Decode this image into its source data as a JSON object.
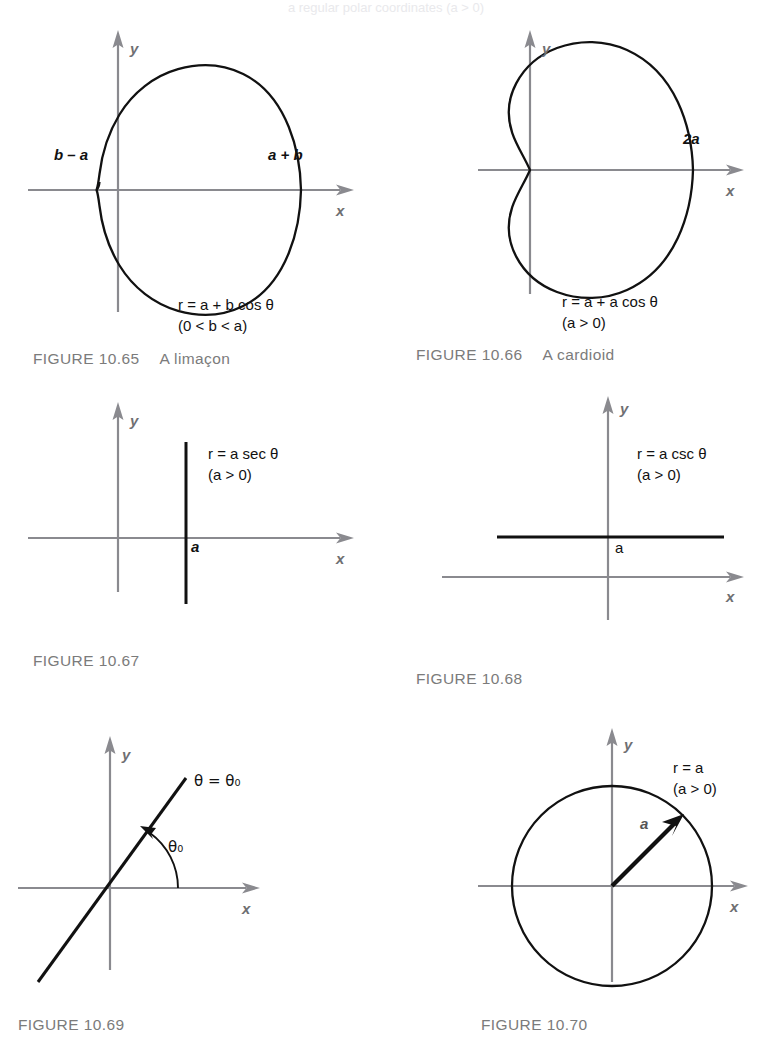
{
  "page": {
    "width": 772,
    "height": 1051,
    "background": "#ffffff",
    "top_bleed_text": "a  regular polar coordinates  (a > 0)"
  },
  "colors": {
    "curve": "#111111",
    "axis": "#8a8a8f",
    "axis_label": "#6f6f72",
    "caption": "#7b7b7b",
    "equation": "#111111"
  },
  "figures": [
    {
      "id": "fig-10-65",
      "caption_number": "FIGURE 10.65",
      "caption_description": "A limaçon",
      "equation_lines": [
        "r = a + b cos θ",
        "(0 < b < a)"
      ],
      "curve_type": "limacon",
      "axis_labels": {
        "x": "x",
        "y": "y"
      },
      "point_labels": [
        {
          "name": "left-intercept-label",
          "text": "b – a"
        },
        {
          "name": "right-intercept-label",
          "text": "a + b"
        }
      ]
    },
    {
      "id": "fig-10-66",
      "caption_number": "FIGURE 10.66",
      "caption_description": "A cardioid",
      "equation_lines": [
        "r = a + a cos θ",
        "(a > 0)"
      ],
      "curve_type": "cardioid",
      "axis_labels": {
        "x": "x",
        "y": "y"
      },
      "point_labels": [
        {
          "name": "right-intercept-label",
          "text": "2a"
        }
      ]
    },
    {
      "id": "fig-10-67",
      "caption_number": "FIGURE 10.67",
      "caption_description": "",
      "equation_lines": [
        "r = a sec θ",
        "(a > 0)"
      ],
      "curve_type": "vertical-line",
      "axis_labels": {
        "x": "x",
        "y": "y"
      },
      "point_labels": [
        {
          "name": "x-intercept-label",
          "text": "a"
        }
      ]
    },
    {
      "id": "fig-10-68",
      "caption_number": "FIGURE 10.68",
      "caption_description": "",
      "equation_lines": [
        "r = a csc θ",
        "(a > 0)"
      ],
      "curve_type": "horizontal-line",
      "axis_labels": {
        "x": "x",
        "y": "y"
      },
      "point_labels": [
        {
          "name": "y-intercept-label",
          "text": "a"
        }
      ]
    },
    {
      "id": "fig-10-69",
      "caption_number": "FIGURE 10.69",
      "caption_description": "",
      "equation_lines": [],
      "curve_type": "ray-through-origin",
      "axis_labels": {
        "x": "x",
        "y": "y"
      },
      "point_labels": [
        {
          "name": "line-equation-label",
          "text": "θ = θ₀"
        },
        {
          "name": "angle-arc-label",
          "text": "θ₀"
        }
      ]
    },
    {
      "id": "fig-10-70",
      "caption_number": "FIGURE 10.70",
      "caption_description": "",
      "equation_lines": [
        "r = a",
        "(a > 0)"
      ],
      "curve_type": "circle",
      "axis_labels": {
        "x": "x",
        "y": "y"
      },
      "point_labels": [
        {
          "name": "radius-vector-label",
          "text": "a"
        }
      ]
    }
  ]
}
